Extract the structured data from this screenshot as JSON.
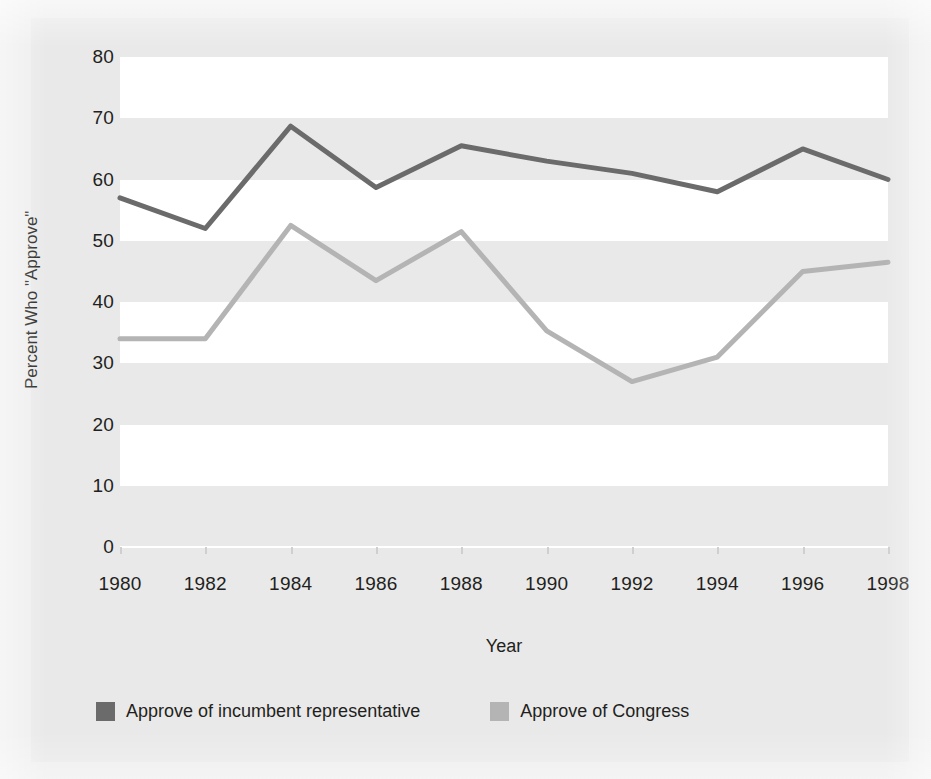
{
  "chart_data": {
    "type": "line",
    "title": "",
    "xlabel": "Year",
    "ylabel": "Percent Who \"Approve\"",
    "x": [
      1980,
      1982,
      1984,
      1986,
      1988,
      1990,
      1992,
      1994,
      1996,
      1998
    ],
    "categories": [
      "1980",
      "1982",
      "1984",
      "1986",
      "1988",
      "1990",
      "1992",
      "1994",
      "1996",
      "1998"
    ],
    "xlim": [
      1980,
      1998
    ],
    "ylim": [
      0,
      80
    ],
    "yticks": [
      0,
      10,
      20,
      30,
      40,
      50,
      60,
      70,
      80
    ],
    "xticks": [
      "1980",
      "1982",
      "1984",
      "1986",
      "1988",
      "1990",
      "1992",
      "1994",
      "1996",
      "1998"
    ],
    "grid": false,
    "banded_background": true,
    "legend_position": "bottom",
    "series": [
      {
        "name": "Approve of incumbent representative",
        "color": "#6b6b6b",
        "values": [
          57,
          52,
          68.7,
          58.7,
          65.5,
          63,
          61,
          58,
          65,
          60
        ]
      },
      {
        "name": "Approve of Congress",
        "color": "#b4b4b4",
        "values": [
          34,
          34,
          52.5,
          43.5,
          51.5,
          35.3,
          27,
          31,
          45,
          46.5
        ]
      }
    ]
  },
  "axes": {
    "y_title": "Percent Who \"Approve\"",
    "x_title": "Year",
    "y_tick_labels": [
      "80",
      "70",
      "60",
      "50",
      "40",
      "30",
      "20",
      "10",
      "0"
    ],
    "x_tick_labels": [
      "1980",
      "1982",
      "1984",
      "1986",
      "1988",
      "1990",
      "1992",
      "1994",
      "1996",
      "1998"
    ]
  },
  "legend": {
    "items": [
      {
        "label": "Approve of incumbent representative",
        "color": "#6b6b6b"
      },
      {
        "label": "Approve of Congress",
        "color": "#b4b4b4"
      }
    ]
  },
  "colors": {
    "incumbent_line": "#6b6b6b",
    "congress_line": "#b4b4b4",
    "figure_background": "#e9e9e9",
    "band_background": "#ffffff",
    "text": "#231f20"
  }
}
